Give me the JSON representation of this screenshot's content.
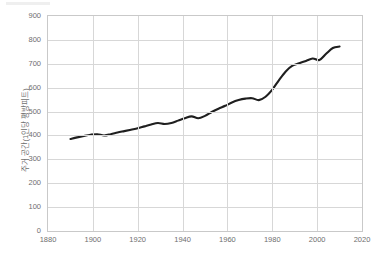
{
  "chart_data": {
    "type": "line",
    "title": "",
    "subtitle": "",
    "xlabel": "",
    "ylabel": "주거 공간(1인당 평방피트)",
    "xlim": [
      1880,
      2020
    ],
    "ylim": [
      0,
      900
    ],
    "xticks": [
      1880,
      1900,
      1920,
      1940,
      1960,
      1980,
      2000,
      2020
    ],
    "yticks": [
      0,
      100,
      200,
      300,
      400,
      500,
      600,
      700,
      800,
      900
    ],
    "grid": true,
    "legend": null,
    "series": [
      {
        "name": "주거 공간(1인당 평방피트)",
        "color": "#1f1f1f",
        "x": [
          1890,
          1893,
          1896,
          1899,
          1902,
          1905,
          1908,
          1911,
          1914,
          1917,
          1920,
          1923,
          1926,
          1929,
          1932,
          1935,
          1938,
          1941,
          1944,
          1947,
          1950,
          1953,
          1956,
          1959,
          1962,
          1965,
          1968,
          1971,
          1974,
          1977,
          1980,
          1983,
          1986,
          1989,
          1992,
          1995,
          1998,
          2001,
          2004,
          2007,
          2010
        ],
        "y": [
          385,
          392,
          398,
          403,
          405,
          400,
          405,
          412,
          418,
          424,
          430,
          438,
          446,
          452,
          448,
          452,
          462,
          472,
          480,
          472,
          482,
          498,
          512,
          524,
          538,
          548,
          554,
          556,
          548,
          562,
          592,
          632,
          668,
          692,
          702,
          712,
          722,
          716,
          742,
          766,
          772
        ]
      }
    ]
  },
  "axis": {
    "y_tick_labels": [
      "0",
      "100",
      "200",
      "300",
      "400",
      "500",
      "600",
      "700",
      "800",
      "900"
    ],
    "x_tick_labels": [
      "1880",
      "1900",
      "1920",
      "1940",
      "1960",
      "1980",
      "2000",
      "2020"
    ]
  },
  "colors": {
    "series": "#1f1f1f",
    "grid": "#d7d7d7",
    "frame": "#c9c9c9",
    "text": "#6e6e6e",
    "background": "#ffffff"
  }
}
